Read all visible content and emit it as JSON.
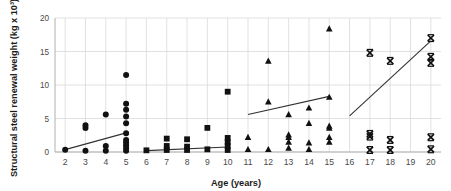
{
  "chart_data": {
    "type": "scatter",
    "title": "",
    "xlabel": "Age (years)",
    "ylabel": "Structural steel renewal weight (kg x 10³)",
    "xlim": [
      1.5,
      20.5
    ],
    "ylim": [
      0,
      20
    ],
    "xticks": [
      2,
      3,
      4,
      5,
      6,
      7,
      8,
      9,
      10,
      11,
      12,
      13,
      14,
      15,
      16,
      17,
      18,
      19,
      20
    ],
    "yticks": [
      0,
      5,
      10,
      15,
      20
    ],
    "grid": "vertical-and-horizontal-light",
    "legend": "none",
    "marker_color": "#111111",
    "trendline_color": "#333333",
    "gridline_color": "#d9d9d9",
    "axis_color": "#b0b0b0",
    "series": [
      {
        "name": "Age 2-5 group",
        "marker": "circle",
        "points": [
          {
            "x": 2,
            "y": 0.35
          },
          {
            "x": 3,
            "y": 0.2
          },
          {
            "x": 3,
            "y": 3.6
          },
          {
            "x": 3,
            "y": 4.0
          },
          {
            "x": 4,
            "y": 0.2
          },
          {
            "x": 4,
            "y": 0.9
          },
          {
            "x": 4,
            "y": 5.6
          },
          {
            "x": 5,
            "y": 0.2
          },
          {
            "x": 5,
            "y": 0.6
          },
          {
            "x": 5,
            "y": 1.0
          },
          {
            "x": 5,
            "y": 1.4
          },
          {
            "x": 5,
            "y": 1.8
          },
          {
            "x": 5,
            "y": 2.8
          },
          {
            "x": 5,
            "y": 4.3
          },
          {
            "x": 5,
            "y": 5.3
          },
          {
            "x": 5,
            "y": 6.3
          },
          {
            "x": 5,
            "y": 7.2
          },
          {
            "x": 5,
            "y": 11.5
          }
        ]
      },
      {
        "name": "Age 6-10 group",
        "marker": "square",
        "points": [
          {
            "x": 6,
            "y": 0.25
          },
          {
            "x": 7,
            "y": 0.3
          },
          {
            "x": 7,
            "y": 0.9
          },
          {
            "x": 7,
            "y": 2.0
          },
          {
            "x": 8,
            "y": 0.3
          },
          {
            "x": 8,
            "y": 0.8
          },
          {
            "x": 8,
            "y": 1.9
          },
          {
            "x": 9,
            "y": 0.4
          },
          {
            "x": 9,
            "y": 3.6
          },
          {
            "x": 10,
            "y": 0.3
          },
          {
            "x": 10,
            "y": 0.9
          },
          {
            "x": 10,
            "y": 1.5
          },
          {
            "x": 10,
            "y": 2.1
          },
          {
            "x": 10,
            "y": 9.0
          }
        ]
      },
      {
        "name": "Age 11-15 group",
        "marker": "triangle",
        "points": [
          {
            "x": 11,
            "y": 0.4
          },
          {
            "x": 11,
            "y": 2.2
          },
          {
            "x": 12,
            "y": 0.4
          },
          {
            "x": 12,
            "y": 7.5
          },
          {
            "x": 12,
            "y": 13.6
          },
          {
            "x": 13,
            "y": 0.6
          },
          {
            "x": 13,
            "y": 1.5
          },
          {
            "x": 13,
            "y": 2.2
          },
          {
            "x": 13,
            "y": 2.6
          },
          {
            "x": 13,
            "y": 5.6
          },
          {
            "x": 14,
            "y": 0.4
          },
          {
            "x": 14,
            "y": 1.4
          },
          {
            "x": 14,
            "y": 4.3
          },
          {
            "x": 14,
            "y": 6.6
          },
          {
            "x": 15,
            "y": 1.5
          },
          {
            "x": 15,
            "y": 2.2
          },
          {
            "x": 15,
            "y": 3.6
          },
          {
            "x": 15,
            "y": 3.9
          },
          {
            "x": 15,
            "y": 8.2
          },
          {
            "x": 15,
            "y": 18.4
          }
        ]
      },
      {
        "name": "Age 16-20 group",
        "marker": "x",
        "points": [
          {
            "x": 17,
            "y": 0.3
          },
          {
            "x": 17,
            "y": 2.3
          },
          {
            "x": 17,
            "y": 2.7
          },
          {
            "x": 17,
            "y": 14.8
          },
          {
            "x": 18,
            "y": 0.3
          },
          {
            "x": 18,
            "y": 1.8
          },
          {
            "x": 18,
            "y": 13.6
          },
          {
            "x": 20,
            "y": 0.4
          },
          {
            "x": 20,
            "y": 2.2
          },
          {
            "x": 20,
            "y": 13.3
          },
          {
            "x": 20,
            "y": 14.2
          },
          {
            "x": 20,
            "y": 17.0
          }
        ]
      }
    ],
    "trendlines": [
      {
        "name": "trend-age-2-5",
        "x0": 2,
        "y0": 0.35,
        "x1": 5,
        "y1": 2.85
      },
      {
        "name": "trend-age-6-10",
        "x0": 6,
        "y0": 0.2,
        "x1": 10,
        "y1": 0.75
      },
      {
        "name": "trend-age-11-15",
        "x0": 11,
        "y0": 5.6,
        "x1": 15,
        "y1": 8.3
      },
      {
        "name": "trend-age-16-20",
        "x0": 16,
        "y0": 5.4,
        "x1": 20,
        "y1": 16.6
      }
    ]
  }
}
